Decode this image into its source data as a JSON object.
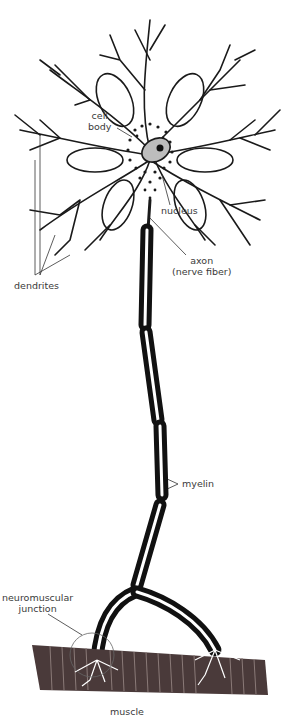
{
  "diagram": {
    "labels": {
      "cell_body_1": "cell",
      "cell_body_2": "body",
      "nucleus": "nucleus",
      "axon_1": "axon",
      "axon_2": "(nerve fiber)",
      "dendrites": "dendrites",
      "myelin": "myelin",
      "nmj_1": "neuromuscular",
      "nmj_2": "junction",
      "muscle": "muscle"
    },
    "colors": {
      "ink": "#1a1a1a",
      "myelin": "#111111",
      "muscle": "#4a3a3a",
      "muscle_stripe": "#8a7a78",
      "background": "#ffffff"
    }
  }
}
